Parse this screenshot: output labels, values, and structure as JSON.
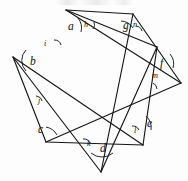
{
  "figure": {
    "name": "seven-pointed-star-angle-diagram",
    "stroke_color": "#151515",
    "background_color": "#fdfdfd",
    "point_count": 7
  },
  "outer_angles": [
    {
      "id": "a",
      "label": "a"
    },
    {
      "id": "b",
      "label": "b"
    },
    {
      "id": "c",
      "label": "c"
    },
    {
      "id": "d",
      "label": "d"
    },
    {
      "id": "e",
      "label": "e"
    },
    {
      "id": "f",
      "label": "f"
    },
    {
      "id": "g",
      "label": "g"
    }
  ],
  "inner_angles": [
    {
      "id": "h",
      "label": "h"
    },
    {
      "id": "i",
      "label": "i"
    },
    {
      "id": "j",
      "label": "j"
    },
    {
      "id": "k",
      "label": "k"
    },
    {
      "id": "l",
      "label": "l"
    },
    {
      "id": "m",
      "label": "m"
    },
    {
      "id": "n",
      "label": "n"
    }
  ]
}
